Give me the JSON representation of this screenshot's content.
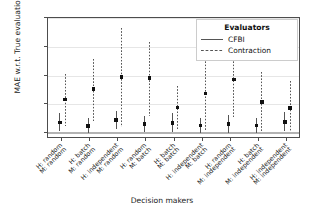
{
  "chart_data": {
    "type": "scatter",
    "title": "",
    "xlabel": "Decision makers",
    "ylabel": "MAE w.r.t. True evaluation",
    "ylim": [
      -0.004,
      0.08
    ],
    "yticks": [
      "0.00",
      "0.02",
      "0.04",
      "0.06",
      "0.08"
    ],
    "ytick_values": [
      0.0,
      0.02,
      0.04,
      0.06,
      0.08
    ],
    "grid": true,
    "legend_position": "upper right",
    "legend_title": "Evaluators",
    "categories": [
      {
        "human": "H: random",
        "machine": "M: random"
      },
      {
        "human": "H: batch",
        "machine": "M: random"
      },
      {
        "human": "H: independent",
        "machine": "M: random"
      },
      {
        "human": "H: random",
        "machine": "M: batch"
      },
      {
        "human": "H: batch",
        "machine": "M: batch"
      },
      {
        "human": "H: independent",
        "machine": "M: batch"
      },
      {
        "human": "H: random",
        "machine": "M: independent"
      },
      {
        "human": "H: batch",
        "machine": "M: independent"
      },
      {
        "human": "H: independent",
        "machine": "M: independent"
      }
    ],
    "series": [
      {
        "name": "CFBI",
        "linestyle": "solid",
        "color": "#555555",
        "values": [
          0.0075,
          0.0051,
          0.0092,
          0.0063,
          0.0072,
          0.0052,
          0.0063,
          0.0053,
          0.0079
        ],
        "err_low": [
          0.0012,
          0.0,
          0.0028,
          0.0008,
          0.0006,
          0.0003,
          0.0004,
          0.0004,
          0.0012
        ],
        "err_high": [
          0.0139,
          0.0103,
          0.0152,
          0.0121,
          0.014,
          0.0103,
          0.0124,
          0.0105,
          0.0148
        ]
      },
      {
        "name": "Contraction",
        "linestyle": "dashed",
        "color": "#555555",
        "values": [
          0.0233,
          0.0308,
          0.039,
          0.0383,
          0.018,
          0.0277,
          0.0374,
          0.0218,
          0.0174
        ],
        "err_low": [
          0.0049,
          0.0088,
          0.0046,
          0.012,
          0.0031,
          0.0022,
          0.011,
          0.0015,
          0.0013
        ],
        "err_high": [
          0.0413,
          0.0518,
          0.0733,
          0.0632,
          0.0326,
          0.054,
          0.0543,
          0.0428,
          0.0362
        ]
      }
    ]
  },
  "legend": {
    "title": "Evaluators",
    "entries": [
      {
        "label": "CFBI",
        "style": "solid"
      },
      {
        "label": "Contraction",
        "style": "dashed"
      }
    ]
  },
  "axes": {
    "x_title": "Decision makers",
    "y_title": "MAE w.r.t. True evaluation"
  }
}
